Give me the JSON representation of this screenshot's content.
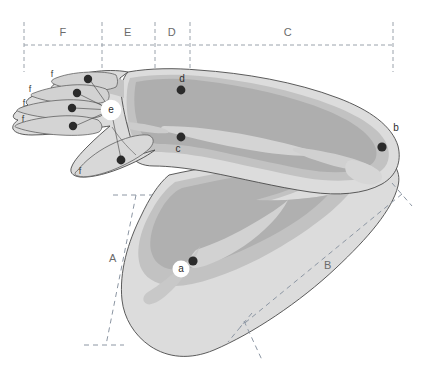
{
  "figure": {
    "background_color": "#ffffff",
    "segment_labels": [
      {
        "id": "F",
        "text": "F",
        "x": 63,
        "y": 33
      },
      {
        "id": "E",
        "text": "E",
        "x": 128,
        "y": 33
      },
      {
        "id": "D",
        "text": "D",
        "x": 172,
        "y": 33
      },
      {
        "id": "C",
        "text": "C",
        "x": 288,
        "y": 33
      }
    ],
    "bracket_labels": [
      {
        "id": "A",
        "text": "A",
        "x": 113,
        "y": 259
      },
      {
        "id": "B",
        "text": "B",
        "x": 328,
        "y": 266
      }
    ],
    "point_labels": [
      {
        "id": "a",
        "text": "a",
        "x": 181,
        "y": 269,
        "halo": true
      },
      {
        "id": "b",
        "text": "b",
        "x": 396,
        "y": 128,
        "halo": false
      },
      {
        "id": "c",
        "text": "c",
        "x": 178,
        "y": 149,
        "halo": false
      },
      {
        "id": "d",
        "text": "d",
        "x": 182,
        "y": 79,
        "halo": false
      },
      {
        "id": "e",
        "text": "e",
        "x": 111,
        "y": 110,
        "halo": true
      }
    ],
    "finger_labels": [
      {
        "id": "f1",
        "text": "f",
        "x": 52,
        "y": 75
      },
      {
        "id": "f2",
        "text": "f",
        "x": 30,
        "y": 90
      },
      {
        "id": "f3",
        "text": "f",
        "x": 24,
        "y": 104
      },
      {
        "id": "f4",
        "text": "f",
        "x": 23,
        "y": 120
      },
      {
        "id": "f5",
        "text": "f",
        "x": 80,
        "y": 172
      }
    ],
    "markers": [
      {
        "id": "marker-finger-1",
        "x": 88,
        "y": 79,
        "r": 4.2
      },
      {
        "id": "marker-finger-2",
        "x": 77,
        "y": 93,
        "r": 4.2
      },
      {
        "id": "marker-finger-3",
        "x": 72,
        "y": 108,
        "r": 4.2
      },
      {
        "id": "marker-finger-4",
        "x": 73,
        "y": 126,
        "r": 4.2
      },
      {
        "id": "marker-thumb",
        "x": 121,
        "y": 160,
        "r": 4.4
      },
      {
        "id": "marker-d",
        "x": 181,
        "y": 90,
        "r": 4.4
      },
      {
        "id": "marker-c",
        "x": 181,
        "y": 137,
        "r": 4.4
      },
      {
        "id": "marker-b",
        "x": 382,
        "y": 147,
        "r": 4.6
      },
      {
        "id": "marker-a",
        "x": 193,
        "y": 261,
        "r": 4.6
      }
    ],
    "colors": {
      "skin_light": "#dadada",
      "skin_mid": "#c6c6c6",
      "skin_dark": "#b4b4b4",
      "skin_darker": "#a8a8a8",
      "outline": "#4a4a4a",
      "dash": "#9aa2ab",
      "marker": "#2b2b2b",
      "label_text": "#6b6b6b"
    },
    "guide_lines": {
      "horizontal_y": 45,
      "horizontal_x_start": 24,
      "horizontal_x_end": 393,
      "vertical_x_positions": [
        24,
        102,
        155,
        190,
        393
      ],
      "vertical_y_top": 22,
      "vertical_y_bottom": 72
    }
  }
}
